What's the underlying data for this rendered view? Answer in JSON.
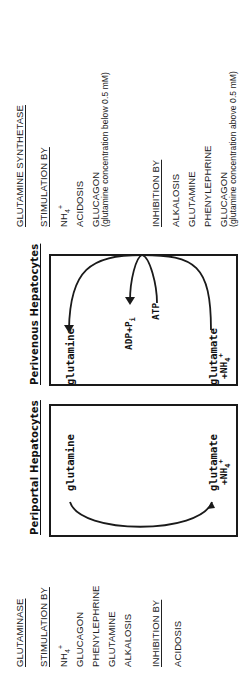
{
  "glutaminase": {
    "title": "GLUTAMINASE",
    "stimulation_heading": "STIMULATION BY",
    "stimulators": [
      {
        "label": "NH",
        "sub": "4",
        "sup": "+"
      },
      {
        "label": "GLUCAGON"
      },
      {
        "label": "PHENYLEPHRINE"
      },
      {
        "label": "GLUTAMINE"
      },
      {
        "label": "ALKALOSIS"
      }
    ],
    "inhibition_heading": "INHIBITION BY",
    "inhibitors": [
      {
        "label": "ACIDOSIS"
      }
    ]
  },
  "periportal": {
    "title": "Periportal Hepatocytes",
    "substrate": "glutamine",
    "product_line1": "glutamate",
    "product_line2": "+NH",
    "product_sub": "4",
    "product_sup": "+"
  },
  "perivenous": {
    "title": "Perivenous Hepatocytes",
    "product": "glutamine",
    "cofactor_out": "ADP+P",
    "cofactor_out_sub": "i",
    "cofactor_in": "ATP",
    "substrate_line1": "glutamate",
    "substrate_line2": "+NH",
    "substrate_sub": "4",
    "substrate_sup": "+"
  },
  "glutamine_synthetase": {
    "title": "GLUTAMINE SYNTHETASE",
    "stimulation_heading": "STIMULATION BY",
    "stimulators": [
      {
        "label": "NH",
        "sub": "4",
        "sup": "+"
      },
      {
        "label": "ACIDOSIS"
      },
      {
        "label": "GLUCAGON",
        "note": "(glutamine concentration below 0.5 mM)"
      }
    ],
    "inhibition_heading": "INHIBITION BY",
    "inhibitors": [
      {
        "label": "ALKALOSIS"
      },
      {
        "label": "GLUTAMINE"
      },
      {
        "label": "PHENYLEPHRINE"
      },
      {
        "label": "GLUCAGON",
        "note": "(glutamine concentration above 0.5 mM)"
      }
    ]
  },
  "colors": {
    "ink": "#1a1a1a",
    "background": "#ffffff"
  }
}
